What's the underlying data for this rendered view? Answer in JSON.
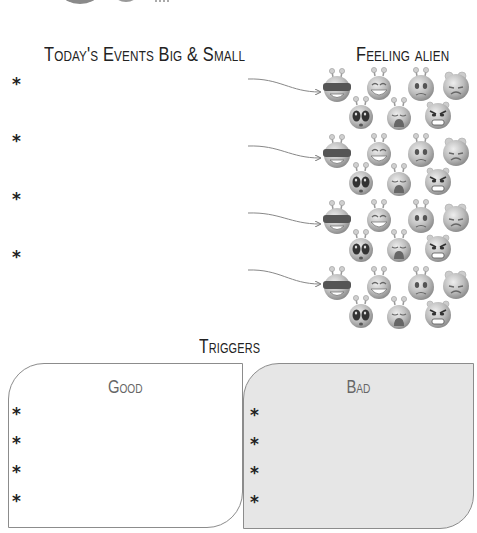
{
  "events": {
    "heading": "Today's Events Big & Small",
    "bullets": [
      "*",
      "*",
      "*",
      "*"
    ]
  },
  "aliens": {
    "heading": "Feeling alien",
    "faces": [
      "cool",
      "laughing",
      "worried",
      "sad",
      "shocked",
      "crying",
      "angry"
    ]
  },
  "triggers": {
    "heading": "Triggers",
    "good": {
      "title": "Good",
      "bullets": [
        "*",
        "*",
        "*",
        "*"
      ]
    },
    "bad": {
      "title": "Bad",
      "bullets": [
        "*",
        "*",
        "*",
        "*"
      ]
    }
  },
  "colors": {
    "text": "#222222",
    "box_border": "#8c8c8c",
    "bad_fill": "#e6e6e6",
    "arrow": "#777777",
    "alien_gray": "#b5b5b5"
  }
}
